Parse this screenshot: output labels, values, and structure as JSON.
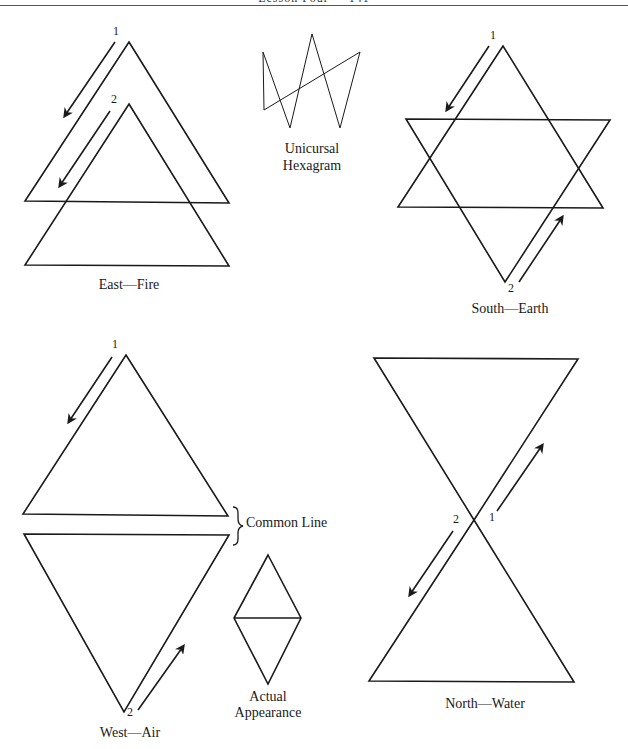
{
  "header": {
    "title": "Lesson Four",
    "page": "141"
  },
  "figures": {
    "east": {
      "label": "East—Fire",
      "start1": "1",
      "start2": "2"
    },
    "hexagram": {
      "label_line1": "Unicursal",
      "label_line2": "Hexagram"
    },
    "south": {
      "label": "South—Earth",
      "start1": "1",
      "start2": "2"
    },
    "west": {
      "label": "West—Air",
      "start1": "1",
      "start2": "2",
      "common_line": "Common Line"
    },
    "actual": {
      "label_line1": "Actual",
      "label_line2": "Appearance"
    },
    "north": {
      "label": "North—Water",
      "start1": "1",
      "start2": "2"
    }
  },
  "colors": {
    "stroke": "#1a1a1a",
    "background": "#ffffff"
  }
}
